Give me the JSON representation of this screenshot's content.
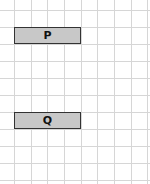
{
  "grid": {
    "vertical_lines_x": [
      14,
      31,
      47,
      64,
      81,
      97,
      114,
      131,
      147
    ],
    "horizontal_lines_y": [
      10,
      27,
      44,
      61,
      78,
      95,
      112,
      129,
      146,
      163,
      180
    ],
    "line_color": "#d6d6d6"
  },
  "boxes": [
    {
      "label": "P",
      "x": 14,
      "y": 27,
      "w": 67,
      "h": 17,
      "fill": "#c8c8c8"
    },
    {
      "label": "Q",
      "x": 14,
      "y": 112,
      "w": 67,
      "h": 17,
      "fill": "#c8c8c8"
    }
  ]
}
